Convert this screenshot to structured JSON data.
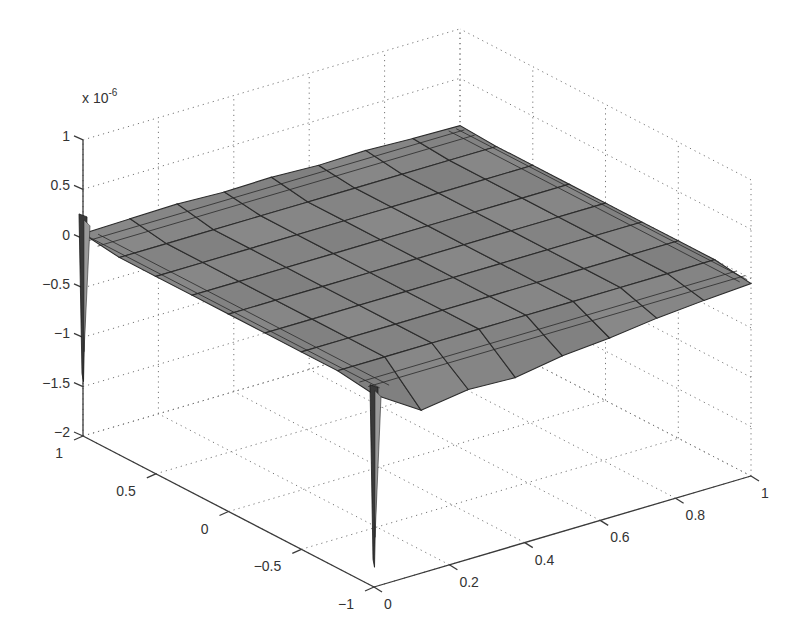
{
  "chart_data": {
    "type": "surface3d",
    "title": "",
    "xlabel": "",
    "ylabel": "",
    "zlabel": "",
    "z_scale_label": "x 10",
    "z_scale_exponent": "-6",
    "xlim": [
      0,
      1
    ],
    "ylim": [
      -1,
      1
    ],
    "zlim": [
      -2,
      1
    ],
    "x_ticks": [
      0,
      0.2,
      0.4,
      0.6,
      0.8,
      1
    ],
    "x_tick_labels": [
      "0",
      "0.2",
      "0.4",
      "0.6",
      "0.8",
      "1"
    ],
    "y_ticks": [
      -1,
      -0.5,
      0,
      0.5,
      1
    ],
    "y_tick_labels": [
      "−1",
      "−0.5",
      "0",
      "0.5",
      "1"
    ],
    "z_ticks": [
      -2,
      -1.5,
      -1,
      -0.5,
      0,
      0.5,
      1
    ],
    "z_tick_labels": [
      "−2",
      "−1.5",
      "−1",
      "−0.5",
      "0",
      "0.5",
      "1"
    ],
    "grid": true,
    "surface": {
      "description": "Nearly flat error surface at z ≈ 0 (×10⁻⁶) over x∈[0,1], y∈[-1,1], with sharp negative spikes at the x=0 corners",
      "base_value": 0,
      "x_grid": [
        0,
        0.125,
        0.25,
        0.375,
        0.5,
        0.625,
        0.75,
        0.875,
        1
      ],
      "y_grid": [
        -1,
        -0.75,
        -0.5,
        -0.25,
        0,
        0.25,
        0.5,
        0.75,
        1
      ],
      "edge_wiggle_y_plus1": [
        0.05,
        0.06,
        0.07,
        0.05,
        0.06,
        0.04,
        0.05,
        0.03,
        0.02
      ],
      "edge_wiggle_y_minus1": [
        -0.05,
        -0.35,
        -0.28,
        -0.3,
        -0.22,
        -0.18,
        -0.12,
        -0.08,
        -0.05
      ],
      "spikes": [
        {
          "x": 0,
          "y": 1,
          "z_min": -1.45,
          "z_max": 0.25
        },
        {
          "x": 0,
          "y": -1,
          "z_min": -1.8,
          "z_max": 0.05
        }
      ],
      "face_color": "#8a8a8a",
      "edge_color": "#2c2c2c"
    },
    "view": "default MATLAB 3-D view (azimuth -37.5°, elevation 30°)"
  }
}
